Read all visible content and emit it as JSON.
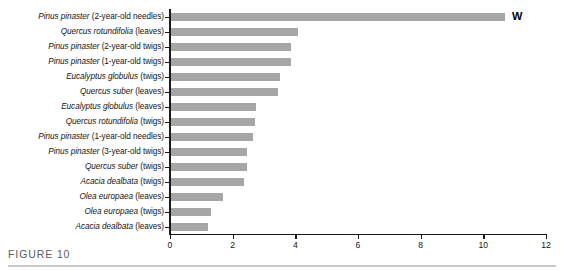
{
  "caption": {
    "label": "FIGURE 10"
  },
  "annotation": {
    "unit": "W"
  },
  "chart_data": {
    "type": "bar",
    "orientation": "horizontal",
    "title": "",
    "xlabel": "",
    "ylabel": "",
    "xlim": [
      0,
      12
    ],
    "xticks": [
      "0",
      "2",
      "4",
      "6",
      "8",
      "10",
      "12"
    ],
    "grid": false,
    "legend": null,
    "bar_color": "#a6a6a6",
    "axis_color": "#1a1a1a",
    "annotation": "W",
    "categories": [
      "Pinus pinaster (2-year-old needles)",
      "Quercus rotundifolia (leaves)",
      "Pinus pinaster (2-year-old twigs)",
      "Pinus pinaster (1-year-old twigs)",
      "Eucalyptus globulus (twigs)",
      "Quercus suber (leaves)",
      "Eucalyptus globulus (leaves)",
      "Quercus rotundifolia (twigs)",
      "Pinus pinaster (1-year-old needles)",
      "Pinus pinaster (3-year-old twigs)",
      "Quercus suber (twigs)",
      "Acacia dealbata (twigs)",
      "Olea europaea (leaves)",
      "Olea europaea (twigs)",
      "Acacia dealbata (leaves)"
    ],
    "values": [
      10.7,
      4.1,
      3.85,
      3.85,
      3.5,
      3.45,
      2.75,
      2.7,
      2.65,
      2.45,
      2.45,
      2.35,
      1.7,
      1.3,
      1.2
    ],
    "items": [
      {
        "genus_species": "Pinus pinaster",
        "qualifier": " (2-year-old needles)",
        "value": 10.7
      },
      {
        "genus_species": "Quercus rotundifolia",
        "qualifier": " (leaves)",
        "value": 4.1
      },
      {
        "genus_species": "Pinus pinaster",
        "qualifier": " (2-year-old twigs)",
        "value": 3.85
      },
      {
        "genus_species": "Pinus pinaster",
        "qualifier": " (1-year-old twigs)",
        "value": 3.85
      },
      {
        "genus_species": "Eucalyptus globulus",
        "qualifier": " (twigs)",
        "value": 3.5
      },
      {
        "genus_species": "Quercus suber",
        "qualifier": " (leaves)",
        "value": 3.45
      },
      {
        "genus_species": "Eucalyptus globulus",
        "qualifier": " (leaves)",
        "value": 2.75
      },
      {
        "genus_species": "Quercus rotundifolia",
        "qualifier": " (twigs)",
        "value": 2.7
      },
      {
        "genus_species": "Pinus pinaster",
        "qualifier": " (1-year-old needles)",
        "value": 2.65
      },
      {
        "genus_species": "Pinus pinaster",
        "qualifier": " (3-year-old twigs)",
        "value": 2.45
      },
      {
        "genus_species": "Quercus suber",
        "qualifier": " (twigs)",
        "value": 2.45
      },
      {
        "genus_species": "Acacia dealbata",
        "qualifier": " (twigs)",
        "value": 2.35
      },
      {
        "genus_species": "Olea europaea",
        "qualifier": " (leaves)",
        "value": 1.7
      },
      {
        "genus_species": "Olea europaea",
        "qualifier": " (twigs)",
        "value": 1.3
      },
      {
        "genus_species": "Acacia dealbata",
        "qualifier": " (leaves)",
        "value": 1.2
      }
    ]
  }
}
